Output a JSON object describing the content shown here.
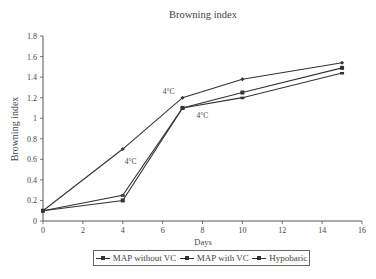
{
  "chart_data": {
    "type": "line",
    "title": "Browning index",
    "xlabel": "Days",
    "ylabel": "Browning index",
    "xlim": [
      0,
      16
    ],
    "ylim": [
      0,
      1.8
    ],
    "x_ticks": [
      "0",
      "2",
      "4",
      "6",
      "8",
      "10",
      "12",
      "14",
      "16"
    ],
    "y_ticks": [
      "0",
      "0.2",
      "0.4",
      "0.6",
      "0.8",
      "1",
      "1.2",
      "1.4",
      "1.6",
      "1.8"
    ],
    "grid": false,
    "legend_position": "bottom",
    "x": [
      0,
      4,
      7,
      10,
      15
    ],
    "series": [
      {
        "name": "MAP without VC",
        "marker": "diamond",
        "values": [
          0.1,
          0.7,
          1.2,
          1.38,
          1.54
        ]
      },
      {
        "name": "MAP with VC",
        "marker": "square",
        "values": [
          0.1,
          0.2,
          1.1,
          1.25,
          1.49
        ]
      },
      {
        "name": "Hypobaric",
        "marker": "dash",
        "values": [
          0.1,
          0.25,
          1.1,
          1.2,
          1.44
        ]
      }
    ],
    "annotations": [
      {
        "text": "4°C",
        "x": 4.4,
        "y": 0.55
      },
      {
        "text": "4°C",
        "x": 6.3,
        "y": 1.24
      },
      {
        "text": "4°C",
        "x": 8.0,
        "y": 1.0
      }
    ]
  },
  "legend": {
    "items": [
      "MAP without VC",
      "MAP with VC",
      "Hypobaric"
    ]
  },
  "colors": {
    "line": "#333333",
    "axis": "#555555",
    "text": "#444444"
  }
}
